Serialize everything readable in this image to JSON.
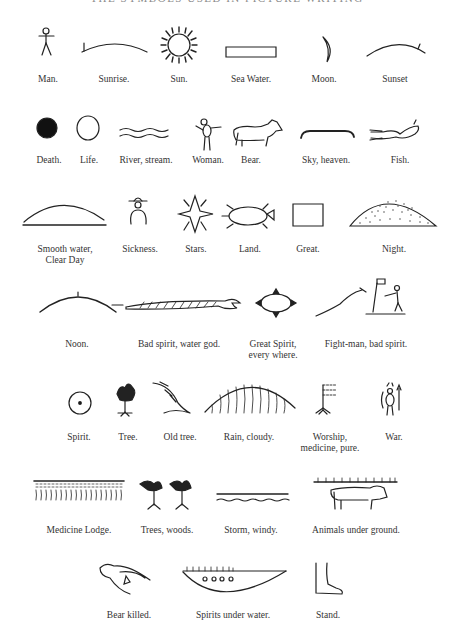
{
  "page": {
    "title": "THE SYMBOLS USED IN PICTURE WRITING"
  },
  "rows": [
    {
      "items": [
        {
          "id": "man",
          "label": "Man.",
          "icon": "stick-figure-icon"
        },
        {
          "id": "sunrise",
          "label": "Sunrise.",
          "icon": "arc-left-tick-icon"
        },
        {
          "id": "sun",
          "label": "Sun.",
          "icon": "sun-rays-icon"
        },
        {
          "id": "sea-water",
          "label": "Sea Water.",
          "icon": "rectangle-icon"
        },
        {
          "id": "moon",
          "label": "Moon.",
          "icon": "crescent-icon"
        },
        {
          "id": "sunset",
          "label": "Sunset",
          "icon": "arc-right-tick-icon"
        }
      ]
    },
    {
      "items": [
        {
          "id": "death",
          "label": "Death.",
          "icon": "filled-circle-icon"
        },
        {
          "id": "life",
          "label": "Life.",
          "icon": "empty-circle-icon"
        },
        {
          "id": "river",
          "label": "River, stream.",
          "icon": "wavy-lines-icon"
        },
        {
          "id": "woman",
          "label": "Woman.",
          "icon": "woman-figure-icon"
        },
        {
          "id": "bear",
          "label": "Bear.",
          "icon": "bear-icon"
        },
        {
          "id": "sky",
          "label": "Sky, heaven.",
          "icon": "sky-arc-icon"
        },
        {
          "id": "fish",
          "label": "Fish.",
          "icon": "fish-icon"
        }
      ]
    },
    {
      "items": [
        {
          "id": "smooth-water",
          "label": "Smooth water,",
          "label2": "Clear Day",
          "icon": "dome-line-icon"
        },
        {
          "id": "sickness",
          "label": "Sickness.",
          "icon": "hat-figure-icon"
        },
        {
          "id": "stars",
          "label": "Stars.",
          "icon": "star-icon"
        },
        {
          "id": "land",
          "label": "Land.",
          "icon": "turtle-icon"
        },
        {
          "id": "great",
          "label": "Great.",
          "icon": "square-icon"
        },
        {
          "id": "night",
          "label": "Night.",
          "icon": "dotted-dome-icon"
        }
      ]
    },
    {
      "items": [
        {
          "id": "noon",
          "label": "Noon.",
          "icon": "arc-top-tick-icon"
        },
        {
          "id": "bad-spirit",
          "label": "Bad spirit, water god.",
          "icon": "serpent-icon"
        },
        {
          "id": "great-spirit",
          "label": "Great Spirit,",
          "label2": "every where.",
          "icon": "oval-triangles-icon"
        },
        {
          "id": "fight-man",
          "label": "Fight-man, bad spirit.",
          "icon": "fight-scene-icon"
        }
      ]
    },
    {
      "items": [
        {
          "id": "spirit",
          "label": "Spirit.",
          "icon": "dot-circle-icon"
        },
        {
          "id": "tree",
          "label": "Tree.",
          "icon": "tree-icon"
        },
        {
          "id": "old-tree",
          "label": "Old tree.",
          "icon": "old-tree-icon"
        },
        {
          "id": "rain",
          "label": "Rain, cloudy.",
          "icon": "rain-dome-icon"
        },
        {
          "id": "worship",
          "label": "Worship,",
          "label2": "medicine, pure.",
          "icon": "flag-pole-icon"
        },
        {
          "id": "war",
          "label": "War.",
          "icon": "warrior-icon"
        }
      ]
    },
    {
      "items": [
        {
          "id": "medicine-lodge",
          "label": "Medicine Lodge.",
          "icon": "lodge-icon"
        },
        {
          "id": "trees",
          "label": "Trees, woods.",
          "icon": "two-trees-icon"
        },
        {
          "id": "storm",
          "label": "Storm, windy.",
          "icon": "line-wave-icon"
        },
        {
          "id": "animals-under",
          "label": "Animals under ground.",
          "icon": "animal-under-line-icon"
        }
      ]
    },
    {
      "items": [
        {
          "id": "bear-killed",
          "label": "Bear killed.",
          "icon": "dead-bear-icon"
        },
        {
          "id": "spirits-under",
          "label": "Spirits under water.",
          "icon": "bowl-circles-icon"
        },
        {
          "id": "stand",
          "label": "Stand.",
          "icon": "foot-icon"
        }
      ]
    }
  ]
}
